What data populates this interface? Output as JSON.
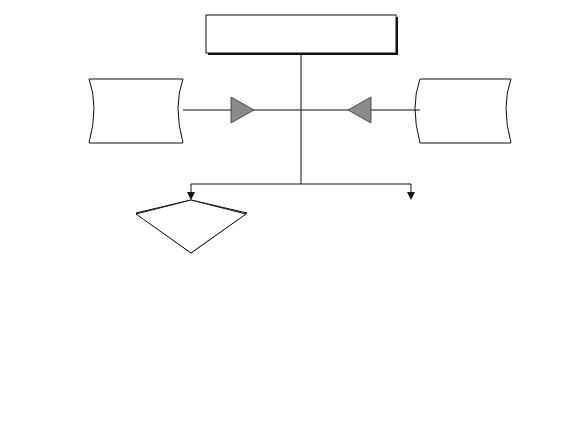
{
  "diagram": {
    "side_label": "Molecular events in the  myocyte",
    "inputs": {
      "left": [
        "Uptake of",
        "circulating",
        "RAAS"
      ],
      "right": [
        "Upregulation of",
        "intramyocardial",
        "RAAS"
      ]
    },
    "decisions": {
      "angiotensin": [
        "Increased",
        "Myocardial",
        "Angiotensin II"
      ],
      "aldosterone": [
        "Increased",
        "Myocardial",
        "Aldosterone"
      ]
    },
    "mid": {
      "p53": [
        "p53 suppressor gene",
        "activation"
      ],
      "at1": [
        "AT 1",
        "subreceptor",
        "activation"
      ],
      "mineralo": [
        "Mineralo-",
        "corticoid",
        "receptor",
        "activation"
      ]
    },
    "outcomes": {
      "apoptosis": "Apoptosis",
      "hypertrophy": "Hypertrophy",
      "collagen": "Collagen synthesis",
      "fibroblast": [
        "Fibroblast",
        "proliferation"
      ]
    },
    "colors": {
      "stroke": "#111111",
      "triangle_fill": "#8a8a8a",
      "background": "#ffffff"
    }
  }
}
